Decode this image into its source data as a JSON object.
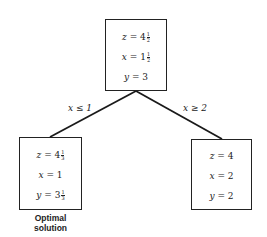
{
  "diagram": {
    "type": "branch-and-bound tree",
    "root": {
      "lines": [
        {
          "var": "z",
          "whole": "4",
          "num": "1",
          "den": "2"
        },
        {
          "var": "x",
          "whole": "1",
          "num": "1",
          "den": "2"
        },
        {
          "var": "y",
          "whole": "3",
          "num": "",
          "den": ""
        }
      ]
    },
    "left": {
      "edge_label": "x ≤ 1",
      "lines": [
        {
          "var": "z",
          "whole": "4",
          "num": "1",
          "den": "3"
        },
        {
          "var": "x",
          "whole": "1",
          "num": "",
          "den": ""
        },
        {
          "var": "y",
          "whole": "3",
          "num": "1",
          "den": "3"
        }
      ],
      "caption_line1": "Optimal",
      "caption_line2": "solution"
    },
    "right": {
      "edge_label": "x ≥ 2",
      "lines": [
        {
          "var": "z",
          "whole": "4",
          "num": "",
          "den": ""
        },
        {
          "var": "x",
          "whole": "2",
          "num": "",
          "den": ""
        },
        {
          "var": "y",
          "whole": "2",
          "num": "",
          "den": ""
        }
      ]
    },
    "eq": " = "
  }
}
